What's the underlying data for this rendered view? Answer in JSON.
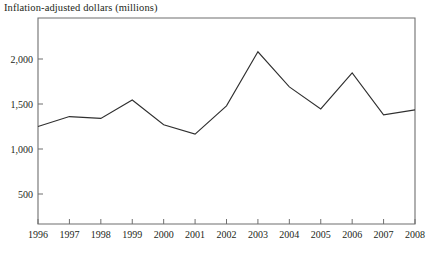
{
  "chart_data": {
    "type": "line",
    "title": "Inflation-adjusted dollars (millions)",
    "xlabel": "",
    "ylabel": "",
    "categories": [
      "1996",
      "1997",
      "1998",
      "1999",
      "2000",
      "2001",
      "2002",
      "2003",
      "2004",
      "2005",
      "2006",
      "2007",
      "2008"
    ],
    "values": [
      1250,
      1360,
      1340,
      1545,
      1270,
      1165,
      1480,
      2080,
      1690,
      1445,
      1845,
      1380,
      1435
    ],
    "series": [
      {
        "name": "Inflation-adjusted dollars (millions)",
        "values": [
          1250,
          1360,
          1340,
          1545,
          1270,
          1165,
          1480,
          2080,
          1690,
          1445,
          1845,
          1380,
          1435
        ]
      }
    ],
    "y_ticks": [
      500,
      1000,
      1500,
      2000
    ],
    "y_tick_labels": [
      "500",
      "1,000",
      "1,500",
      "2,000"
    ],
    "ylim": [
      0,
      2180
    ],
    "xlim": [
      "1996",
      "2008"
    ],
    "grid": false,
    "legend": false,
    "legend_position": "none",
    "line_color": "#2f2f2f",
    "frame_color": "#6f6f6f",
    "text_color": "#231f20"
  }
}
